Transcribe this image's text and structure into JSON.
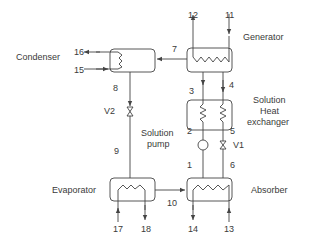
{
  "diagram": {
    "type": "absorption refrigeration cycle schematic",
    "components": {
      "condenser": "Condenser",
      "generator": "Generator",
      "shx_line1": "Solution",
      "shx_line2": "Heat",
      "shx_line3": "exchanger",
      "pump_line1": "Solution",
      "pump_line2": "pump",
      "evaporator": "Evaporator",
      "absorber": "Absorber"
    },
    "valves": {
      "v1": "V1",
      "v2": "V2"
    },
    "state_points": {
      "p1": "1",
      "p2": "2",
      "p3": "3",
      "p4": "4",
      "p5": "5",
      "p6": "6",
      "p7": "7",
      "p8": "8",
      "p9": "9",
      "p10": "10",
      "p11": "11",
      "p12": "12",
      "p13": "13",
      "p14": "14",
      "p15": "15",
      "p16": "16",
      "p17": "17",
      "p18": "18"
    },
    "line_color": "#444444"
  }
}
